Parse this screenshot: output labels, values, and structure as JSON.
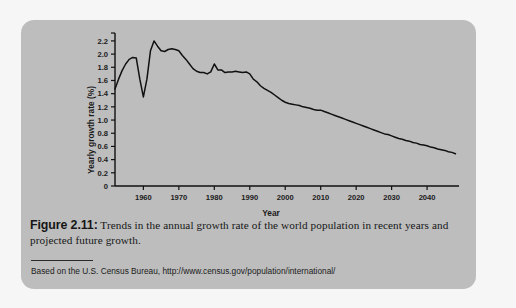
{
  "figure": {
    "caption_label": "Figure 2.11:",
    "caption_body": " Trends in the annual growth rate of the world population in recent years and projected future growth.",
    "source": "Based on the U.S. Census Bureau, http://www.census.gov/population/international/",
    "panel_color": "#bdbdbd",
    "page_color": "#f6f6f6",
    "line_color": "#111111"
  },
  "chart_data": {
    "type": "line",
    "title": "",
    "xlabel": "Year",
    "ylabel": "Yearly growth rate (%)",
    "xlim": [
      1952,
      2049
    ],
    "ylim": [
      0,
      2.32
    ],
    "grid": false,
    "legend": null,
    "xticks": [
      1960,
      1970,
      1980,
      1990,
      2000,
      2010,
      2020,
      2030,
      2040
    ],
    "xtick_labels": [
      "1960",
      "1970",
      "1980",
      "1990",
      "2000",
      "2010",
      "2020",
      "2030",
      "2040"
    ],
    "yticks": [
      0,
      0.2,
      0.4,
      0.6,
      0.8,
      1.0,
      1.2,
      1.4,
      1.6,
      1.8,
      2.0,
      2.2
    ],
    "ytick_labels": [
      "0",
      "0.2",
      "0.4",
      "0.6",
      "0.8",
      "1.0",
      "1.2",
      "1.4",
      "1.6",
      "1.8",
      "2.0",
      "2.2"
    ],
    "series": [
      {
        "name": "World population yearly growth rate",
        "x": [
          1952,
          1953,
          1954,
          1955,
          1956,
          1957,
          1958,
          1959,
          1960,
          1961,
          1962,
          1963,
          1964,
          1965,
          1966,
          1967,
          1968,
          1969,
          1970,
          1971,
          1972,
          1973,
          1974,
          1975,
          1976,
          1977,
          1978,
          1979,
          1980,
          1981,
          1982,
          1983,
          1984,
          1985,
          1986,
          1987,
          1988,
          1989,
          1990,
          1991,
          1992,
          1993,
          1994,
          1995,
          1996,
          1997,
          1998,
          1999,
          2000,
          2001,
          2002,
          2003,
          2004,
          2005,
          2006,
          2007,
          2008,
          2009,
          2010,
          2011,
          2012,
          2013,
          2014,
          2015,
          2016,
          2017,
          2018,
          2019,
          2020,
          2021,
          2022,
          2023,
          2024,
          2025,
          2026,
          2027,
          2028,
          2029,
          2030,
          2031,
          2032,
          2033,
          2034,
          2035,
          2036,
          2037,
          2038,
          2039,
          2040,
          2041,
          2042,
          2043,
          2044,
          2045,
          2046,
          2047,
          2048
        ],
        "y": [
          1.47,
          1.62,
          1.75,
          1.85,
          1.92,
          1.95,
          1.94,
          1.62,
          1.35,
          1.62,
          2.05,
          2.2,
          2.12,
          2.05,
          2.04,
          2.07,
          2.08,
          2.07,
          2.05,
          1.98,
          1.92,
          1.85,
          1.78,
          1.74,
          1.72,
          1.72,
          1.7,
          1.73,
          1.85,
          1.76,
          1.76,
          1.72,
          1.73,
          1.73,
          1.74,
          1.73,
          1.72,
          1.73,
          1.7,
          1.62,
          1.58,
          1.52,
          1.48,
          1.45,
          1.42,
          1.38,
          1.34,
          1.3,
          1.27,
          1.25,
          1.24,
          1.23,
          1.22,
          1.2,
          1.19,
          1.18,
          1.16,
          1.15,
          1.15,
          1.13,
          1.11,
          1.09,
          1.07,
          1.05,
          1.03,
          1.01,
          0.99,
          0.97,
          0.95,
          0.93,
          0.91,
          0.89,
          0.87,
          0.85,
          0.83,
          0.81,
          0.79,
          0.78,
          0.76,
          0.74,
          0.72,
          0.71,
          0.69,
          0.68,
          0.66,
          0.65,
          0.63,
          0.62,
          0.61,
          0.59,
          0.58,
          0.56,
          0.55,
          0.54,
          0.52,
          0.51,
          0.49
        ]
      }
    ]
  }
}
